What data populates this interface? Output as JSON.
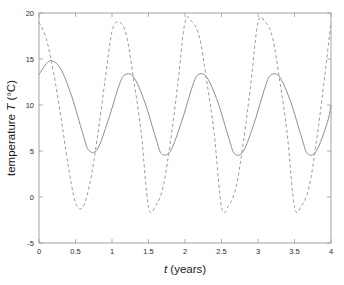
{
  "chart_data": {
    "type": "line",
    "title": "",
    "xlabel": "t (years)",
    "xlabel_italic_part": "t",
    "xlabel_rest": " (years)",
    "ylabel": "temperature T (°C)",
    "ylabel_prefix": "temperature ",
    "ylabel_italic_part": "T",
    "ylabel_suffix": " (°C)",
    "xlim": [
      0,
      4
    ],
    "ylim": [
      -5,
      20
    ],
    "xticks": [
      0,
      0.5,
      1,
      1.5,
      2,
      2.5,
      3,
      3.5,
      4
    ],
    "xtick_labels": [
      "0",
      "0.5",
      "1",
      "1.5",
      "2",
      "2.5",
      "3",
      "3.5",
      "4"
    ],
    "yticks": [
      -5,
      0,
      5,
      10,
      15,
      20
    ],
    "ytick_labels": [
      "-5",
      "0",
      "5",
      "10",
      "15",
      "20"
    ],
    "grid": false,
    "legend": "none",
    "tick_direction": "in",
    "series": [
      {
        "name": "solid-curve",
        "style": "solid",
        "color": "#8e8e8e",
        "mean": 9.0,
        "amplitude": 4.3,
        "period": 1.0,
        "phase_peak_t": 0.18,
        "first_peak_value": 14.8,
        "peak_value": 13.3,
        "trough_value": 4.7,
        "value_at_t0": 13.3,
        "value_at_t4": 10.0,
        "x": [
          0,
          0.1,
          0.18,
          0.3,
          0.45,
          0.6,
          0.68,
          0.8,
          0.95,
          1.1,
          1.18,
          1.3,
          1.45,
          1.6,
          1.68,
          1.8,
          1.95,
          2.1,
          2.18,
          2.3,
          2.45,
          2.6,
          2.68,
          2.8,
          2.95,
          3.1,
          3.18,
          3.3,
          3.45,
          3.6,
          3.68,
          3.8,
          3.95,
          4
        ],
        "y": [
          13.3,
          14.5,
          14.8,
          13.9,
          10.9,
          6.9,
          5.1,
          5.2,
          8.4,
          12.2,
          13.3,
          13.0,
          10.3,
          6.4,
          4.7,
          5.0,
          8.1,
          12.0,
          13.3,
          13.0,
          10.3,
          6.4,
          4.7,
          5.0,
          8.1,
          12.0,
          13.3,
          13.0,
          10.3,
          6.4,
          4.7,
          5.0,
          8.1,
          10.0
        ]
      },
      {
        "name": "dashed-curve",
        "style": "dashed",
        "color": "#9b9b9b",
        "mean": 9.0,
        "amplitude": 10.0,
        "period": 1.0,
        "phase_peak_t": 1.02,
        "peak_value": 19.0,
        "trough_value": -1.1,
        "value_at_t0": 19.0,
        "value_at_t4": 19.0,
        "x": [
          0,
          0.1,
          0.2,
          0.3,
          0.4,
          0.5,
          0.6,
          0.7,
          0.8,
          0.9,
          1.0,
          1.1,
          1.2,
          1.3,
          1.4,
          1.5,
          1.6,
          1.7,
          1.8,
          1.9,
          2.0,
          2.1,
          2.2,
          2.3,
          2.4,
          2.5,
          2.6,
          2.7,
          2.8,
          2.9,
          3.0,
          3.1,
          3.2,
          3.3,
          3.4,
          3.5,
          3.6,
          3.7,
          3.8,
          3.9,
          4.0
        ],
        "y": [
          19.0,
          17.2,
          13.5,
          8.7,
          3.4,
          -0.6,
          -1.1,
          1.6,
          6.5,
          12.4,
          18.0,
          19.0,
          17.5,
          12.6,
          7.0,
          -1.1,
          -0.9,
          1.1,
          6.0,
          12.2,
          19.0,
          19.0,
          17.3,
          12.5,
          6.9,
          -1.1,
          -0.9,
          1.1,
          6.0,
          12.2,
          19.0,
          19.0,
          17.3,
          12.5,
          6.9,
          -1.1,
          -0.9,
          1.1,
          6.0,
          12.2,
          19.0
        ]
      }
    ]
  },
  "figure": {
    "background_color": "#ffffff",
    "axes_color": "#9a9a9a",
    "text_color": "#1a1a1a"
  }
}
